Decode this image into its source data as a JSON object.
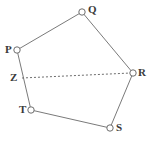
{
  "figure": {
    "canvas": {
      "width": 152,
      "height": 141
    },
    "background_color": "#ffffff",
    "stroke_color": "#7a7a7a",
    "label_color": "#3a3a3a",
    "marker_fill": "#ffffff",
    "stroke_width": 1,
    "vertices": [
      {
        "id": "P",
        "label": "P",
        "cx": 17,
        "cy": 50,
        "r": 3.2,
        "label_x": 5,
        "label_y": 44
      },
      {
        "id": "Q",
        "label": "Q",
        "cx": 82,
        "cy": 12,
        "r": 3.2,
        "label_x": 88,
        "label_y": 4
      },
      {
        "id": "R",
        "label": "R",
        "cx": 133,
        "cy": 73,
        "r": 3.2,
        "label_x": 138,
        "label_y": 67
      },
      {
        "id": "S",
        "label": "S",
        "cx": 110,
        "cy": 128,
        "r": 3.2,
        "label_x": 116,
        "label_y": 122
      },
      {
        "id": "T",
        "label": "T",
        "cx": 31,
        "cy": 110,
        "r": 3.2,
        "label_x": 19,
        "label_y": 104
      }
    ],
    "points": [
      {
        "id": "Z",
        "label": "Z",
        "x": 22,
        "y": 78,
        "label_x": 10,
        "label_y": 72,
        "marker": "none"
      }
    ],
    "solid_edges": [
      {
        "from": "P",
        "to": "Q"
      },
      {
        "from": "Q",
        "to": "R"
      },
      {
        "from": "R",
        "to": "S"
      },
      {
        "from": "S",
        "to": "T"
      },
      {
        "from": "T",
        "to": "P"
      }
    ],
    "dashed_edges": [
      {
        "from": "Z",
        "to": "R",
        "dash_pattern": "2 2"
      }
    ]
  }
}
